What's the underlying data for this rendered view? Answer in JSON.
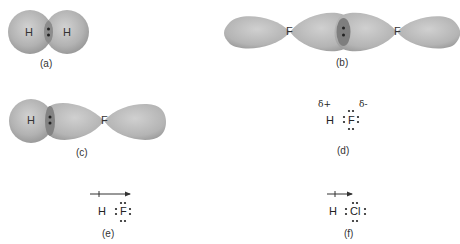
{
  "panels": {
    "a": {
      "label": "(a)",
      "atoms": [
        "H",
        "H"
      ],
      "description": "H2 overlapping s orbitals with shared electron pair"
    },
    "b": {
      "label": "(b)",
      "atoms": [
        "F",
        "F"
      ],
      "description": "F2 overlapping p orbitals with shared electron pair"
    },
    "c": {
      "label": "(c)",
      "atoms": [
        "H",
        "F"
      ],
      "description": "HF s-p orbital overlap"
    },
    "d": {
      "label": "(d)",
      "atoms": [
        "H",
        "F"
      ],
      "delta_plus": "δ+",
      "delta_minus": "δ-",
      "description": "HF Lewis structure with partial charges"
    },
    "e": {
      "label": "(e)",
      "atoms": [
        "H",
        "F"
      ],
      "description": "HF Lewis structure with dipole arrow"
    },
    "f": {
      "label": "(f)",
      "atoms": [
        "H",
        "Cl"
      ],
      "description": "HCl Lewis structure with dipole arrow"
    }
  },
  "colors": {
    "orbital_fill": "#b5b5b5",
    "orbital_shade": "#8f8f8f",
    "overlap": "#7d7d7d",
    "electron": "#222222"
  }
}
